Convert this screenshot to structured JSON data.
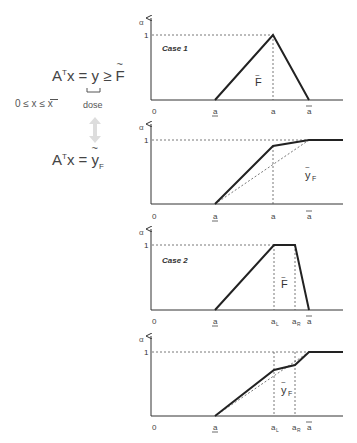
{
  "left": {
    "equation_top": {
      "lhs": "A",
      "sup": "T",
      "mid": "x = ",
      "y": "y",
      "ge": " ≥ ",
      "F": "F"
    },
    "constraint": "0 ≤ x ≤ x",
    "dose_label": "dose",
    "arrow": "double-arrow",
    "equation_bottom": {
      "lhs": "A",
      "sup": "T",
      "mid": "x = ",
      "y": "y",
      "sub": "F"
    }
  },
  "panels": [
    {
      "id": "case1-F",
      "case_label": "Case 1",
      "curve_label": "F",
      "y_axis_label": "α",
      "y_tick": "1",
      "x_ticks": [
        "0",
        "a",
        "a",
        "a"
      ]
    },
    {
      "id": "case1-yF",
      "curve_label": "y",
      "curve_label_sub": "F",
      "y_axis_label": "α",
      "y_tick": "1",
      "x_ticks": [
        "0",
        "a",
        "a",
        "a"
      ]
    },
    {
      "id": "case2-F",
      "case_label": "Case 2",
      "curve_label": "F",
      "y_axis_label": "α",
      "y_tick": "1",
      "x_ticks": [
        "0",
        "a",
        "a",
        "a",
        "a"
      ],
      "x_tick_subs": [
        "",
        "",
        "L",
        "R",
        ""
      ]
    },
    {
      "id": "case2-yF",
      "curve_label": "y",
      "curve_label_sub": "F",
      "y_axis_label": "α",
      "y_tick": "1",
      "x_ticks": [
        "0",
        "a",
        "a",
        "a",
        "a"
      ],
      "x_tick_subs": [
        "",
        "",
        "L",
        "R",
        ""
      ]
    }
  ],
  "colors": {
    "line": "#222222",
    "axis": "#333333",
    "dashed": "#555555",
    "arrow": "#dddddd"
  }
}
